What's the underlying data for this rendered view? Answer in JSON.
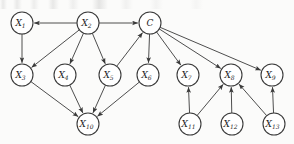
{
  "figure": {
    "kind": "directed-acyclic-graph",
    "background_color": "#fbfbfa",
    "node_fill_color": "#ffffff",
    "node_stroke_color": "#3a3a3a",
    "edge_color": "#3a3a3a",
    "node_radius": 11
  },
  "chart_data": {
    "type": "diagram",
    "title": "",
    "nodes": [
      {
        "id": "X1",
        "base": "X",
        "sub": "1",
        "x": 22,
        "y": 23
      },
      {
        "id": "X2",
        "base": "X",
        "sub": "2",
        "x": 88,
        "y": 23
      },
      {
        "id": "C",
        "base": "C",
        "sub": "",
        "x": 150,
        "y": 23
      },
      {
        "id": "X3",
        "base": "X",
        "sub": "3",
        "x": 22,
        "y": 75
      },
      {
        "id": "X4",
        "base": "X",
        "sub": "4",
        "x": 65,
        "y": 75
      },
      {
        "id": "X5",
        "base": "X",
        "sub": "5",
        "x": 110,
        "y": 75
      },
      {
        "id": "X6",
        "base": "X",
        "sub": "6",
        "x": 148,
        "y": 75
      },
      {
        "id": "X7",
        "base": "X",
        "sub": "7",
        "x": 188,
        "y": 75
      },
      {
        "id": "X8",
        "base": "X",
        "sub": "8",
        "x": 231,
        "y": 75
      },
      {
        "id": "X9",
        "base": "X",
        "sub": "9",
        "x": 272,
        "y": 75
      },
      {
        "id": "X10",
        "base": "X",
        "sub": "10",
        "x": 88,
        "y": 124
      },
      {
        "id": "X11",
        "base": "X",
        "sub": "11",
        "x": 190,
        "y": 124
      },
      {
        "id": "X12",
        "base": "X",
        "sub": "12",
        "x": 232,
        "y": 124
      },
      {
        "id": "X13",
        "base": "X",
        "sub": "13",
        "x": 274,
        "y": 124
      }
    ],
    "edges": [
      {
        "from": "X2",
        "to": "X1"
      },
      {
        "from": "X2",
        "to": "C"
      },
      {
        "from": "X1",
        "to": "X3"
      },
      {
        "from": "X2",
        "to": "X3"
      },
      {
        "from": "X2",
        "to": "X4"
      },
      {
        "from": "X2",
        "to": "X5"
      },
      {
        "from": "X5",
        "to": "C"
      },
      {
        "from": "C",
        "to": "X6"
      },
      {
        "from": "C",
        "to": "X7"
      },
      {
        "from": "C",
        "to": "X8"
      },
      {
        "from": "C",
        "to": "X9"
      },
      {
        "from": "X3",
        "to": "X10"
      },
      {
        "from": "X4",
        "to": "X10"
      },
      {
        "from": "X5",
        "to": "X10"
      },
      {
        "from": "X6",
        "to": "X10"
      },
      {
        "from": "X11",
        "to": "X7"
      },
      {
        "from": "X11",
        "to": "X8"
      },
      {
        "from": "X12",
        "to": "X8"
      },
      {
        "from": "X13",
        "to": "X8"
      },
      {
        "from": "X13",
        "to": "X9"
      }
    ]
  }
}
